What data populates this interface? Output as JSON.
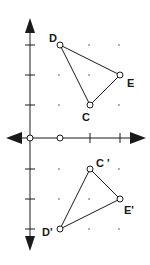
{
  "diagram": {
    "type": "coordinate-plane-reflection",
    "axes": {
      "x_arrows": "both",
      "y_arrows": "both"
    },
    "x_axis_points": [
      0,
      1
    ],
    "triangle_original": {
      "vertices": [
        {
          "label": "D",
          "x": 1,
          "y": 3
        },
        {
          "label": "E",
          "x": 3,
          "y": 2
        },
        {
          "label": "C",
          "x": 2,
          "y": 1
        }
      ]
    },
    "triangle_image": {
      "vertices": [
        {
          "label": "C '",
          "x": 2,
          "y": -1
        },
        {
          "label": "E'",
          "x": 3,
          "y": -2
        },
        {
          "label": "D'",
          "x": 1,
          "y": -3
        }
      ]
    },
    "colors": {
      "stroke": "#1a1a1a",
      "grid_dot": "#555555"
    }
  }
}
